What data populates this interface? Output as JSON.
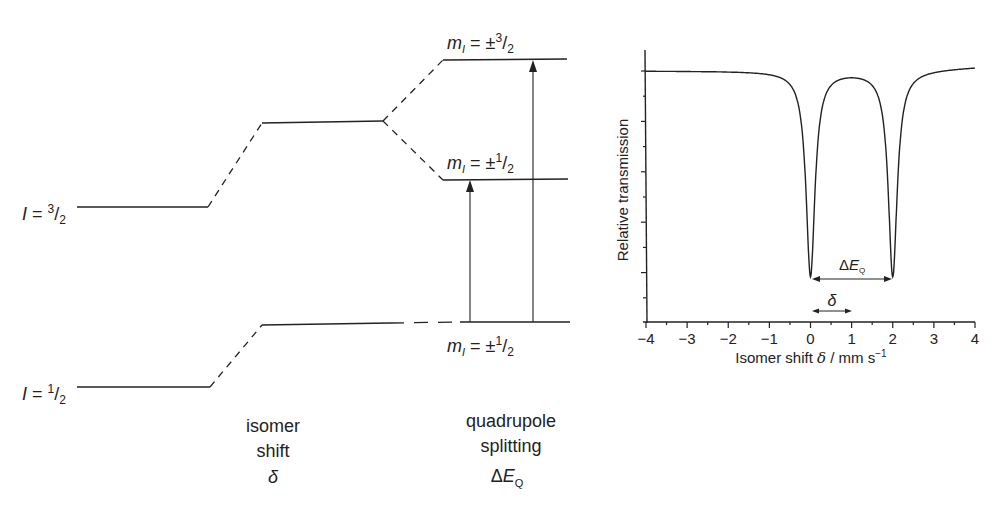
{
  "diagram": {
    "levels": {
      "excited_label": "I = 3/2",
      "ground_label": "I = 1/2",
      "excited_spin_num": "3",
      "ground_spin_num": "1",
      "spin_den": "2",
      "upper_split_label_sign": "±",
      "upper_split_num": "3",
      "lower_split_label_sign": "±",
      "lower_split_num": "1",
      "ground_split_num": "1"
    },
    "captions": {
      "isomer_line1": "isomer",
      "isomer_line2": "shift",
      "isomer_symbol": "δ",
      "quad_line1": "quadrupole",
      "quad_line2": "splitting",
      "quad_symbol_delta": "Δ",
      "quad_symbol_E": "E",
      "quad_symbol_sub": "Q"
    }
  },
  "chart_data": {
    "type": "line",
    "title": "",
    "xlabel": "Isomer shift δ / mm s−1",
    "ylabel": "Relative transmission",
    "xlim": [
      -4,
      4
    ],
    "x_ticks": [
      "−4",
      "−3",
      "−2",
      "−1",
      "0",
      "1",
      "2",
      "3",
      "4"
    ],
    "y_ticks_labeled": false,
    "grid": false,
    "series": [
      {
        "name": "Mössbauer doublet",
        "description": "Two Lorentzian absorption lines centred at 0 and 2 mm/s (doublet centre δ = 1 mm/s, ΔEQ = 2 mm/s)",
        "x": [
          -4,
          -3,
          -2,
          -1,
          -0.5,
          -0.2,
          0,
          0.2,
          0.5,
          1,
          1.5,
          1.8,
          2,
          2.2,
          2.5,
          3,
          4
        ],
        "y": [
          1.0,
          0.998,
          0.995,
          0.98,
          0.94,
          0.8,
          0.27,
          0.8,
          0.92,
          0.96,
          0.92,
          0.8,
          0.27,
          0.8,
          0.94,
          0.98,
          1.01
        ]
      }
    ],
    "annotations": [
      {
        "text": "ΔEQ",
        "from_x": 0,
        "to_x": 2,
        "type": "double-arrow"
      },
      {
        "text": "δ",
        "from_x": 0,
        "to_x": 1,
        "type": "double-arrow"
      }
    ]
  }
}
